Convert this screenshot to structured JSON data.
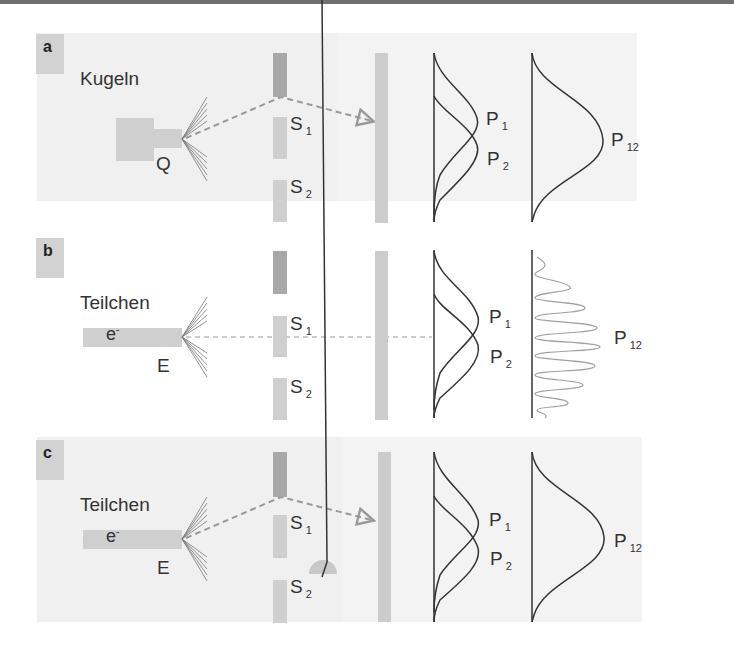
{
  "figure": {
    "panels": [
      {
        "id": "a",
        "label": "a",
        "title": "Kugeln",
        "source_label": "Q",
        "slit_labels": {
          "s1": "S",
          "s1_sub": "1",
          "s2": "S",
          "s2_sub": "2"
        },
        "curve_labels": {
          "p1": "P",
          "p1_sub": "1",
          "p2": "P",
          "p2_sub": "2",
          "p12": "P",
          "p12_sub": "12"
        },
        "pattern": "sum-of-gaussians"
      },
      {
        "id": "b",
        "label": "b",
        "title": "Teilchen",
        "particle_label": "e",
        "particle_sup": "-",
        "source_label": "E",
        "slit_labels": {
          "s1": "S",
          "s1_sub": "1",
          "s2": "S",
          "s2_sub": "2"
        },
        "curve_labels": {
          "p1": "P",
          "p1_sub": "1",
          "p2": "P",
          "p2_sub": "2",
          "p12": "P",
          "p12_sub": "12"
        },
        "pattern": "interference-fringes"
      },
      {
        "id": "c",
        "label": "c",
        "title": "Teilchen",
        "particle_label": "e",
        "particle_sup": "-",
        "source_label": "E",
        "slit_labels": {
          "s1": "S",
          "s1_sub": "1",
          "s2": "S",
          "s2_sub": "2"
        },
        "curve_labels": {
          "p1": "P",
          "p1_sub": "1",
          "p2": "P",
          "p2_sub": "2",
          "p12": "P",
          "p12_sub": "12"
        },
        "detector": "meter-icon",
        "pattern": "sum-of-gaussians"
      }
    ],
    "colors": {
      "panel_bg": "#f0f0f0",
      "label_box": "#d2d2d2",
      "slit_dark": "#a8a8a8",
      "slit_light": "#cfcfcf",
      "screen": "#cccccc",
      "curve": "#333333",
      "fringe": "#a0a0a0",
      "dashed": "#999999"
    }
  }
}
